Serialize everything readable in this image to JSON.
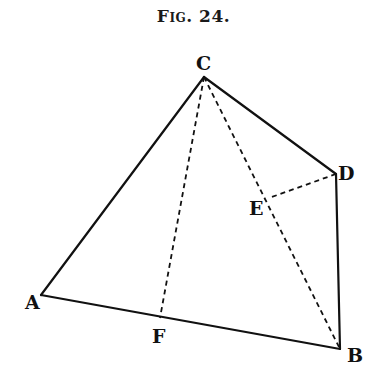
{
  "figure": {
    "title": "Fig. 24."
  },
  "points": {
    "A": {
      "label": "A",
      "x": 41,
      "y": 295,
      "lx": 26,
      "ly": 309
    },
    "B": {
      "label": "B",
      "x": 340,
      "y": 349,
      "lx": 347,
      "ly": 361
    },
    "C": {
      "label": "C",
      "x": 204,
      "y": 77,
      "lx": 196,
      "ly": 70
    },
    "D": {
      "label": "D",
      "x": 336,
      "y": 174,
      "lx": 340,
      "ly": 178
    },
    "E": {
      "label": "E",
      "x": 269,
      "y": 198,
      "lx": 250,
      "ly": 214
    },
    "F": {
      "label": "F",
      "x": 160,
      "y": 318,
      "lx": 152,
      "ly": 343
    }
  },
  "segments": {
    "solid": [
      [
        "A",
        "C"
      ],
      [
        "C",
        "D"
      ],
      [
        "D",
        "B"
      ],
      [
        "A",
        "B"
      ]
    ],
    "dashed": [
      [
        "C",
        "F"
      ],
      [
        "C",
        "B"
      ],
      [
        "D",
        "E"
      ]
    ]
  },
  "colors": {
    "ink": "#111111",
    "background": "#ffffff"
  }
}
